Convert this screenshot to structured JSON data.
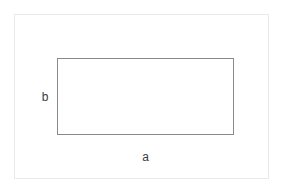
{
  "figure": {
    "type": "geometry-diagram",
    "shape": "rectangle",
    "background_color": "#ffffff",
    "frame": {
      "name": "outer-frame",
      "border_color": "#e9e9e9",
      "border_width_px": 1
    },
    "rectangle": {
      "name": "rectangle",
      "border_color": "#8a8a8a",
      "border_width_px": 1,
      "fill": "none"
    },
    "labels": {
      "width_label": "a",
      "height_label": "b",
      "text_color": "#3b3b3b"
    }
  },
  "chart_data": {
    "type": "diagram",
    "title": "",
    "shape": "rectangle",
    "annotations": [
      {
        "text": "a",
        "role": "width-dimension",
        "position": "below-rectangle-center"
      },
      {
        "text": "b",
        "role": "height-dimension",
        "position": "left-of-rectangle-center"
      }
    ]
  }
}
